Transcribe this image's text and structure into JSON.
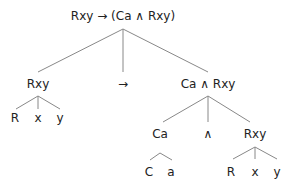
{
  "tree": {
    "root": {
      "label": "Rxy → (Ca ∧ Rxy)",
      "x": 123,
      "y": 16
    },
    "nodes": [
      {
        "id": "l1-rxy",
        "label": "Rxy",
        "x": 38,
        "y": 84
      },
      {
        "id": "l1-arrow",
        "label": "→",
        "x": 123,
        "y": 84
      },
      {
        "id": "l1-conj",
        "label": "Ca ∧ Rxy",
        "x": 208,
        "y": 84
      },
      {
        "id": "l2-R",
        "label": "R",
        "x": 15,
        "y": 118
      },
      {
        "id": "l2-x",
        "label": "x",
        "x": 38,
        "y": 118
      },
      {
        "id": "l2-y",
        "label": "y",
        "x": 60,
        "y": 118
      },
      {
        "id": "l2-Ca",
        "label": "Ca",
        "x": 160,
        "y": 134
      },
      {
        "id": "l2-and",
        "label": "∧",
        "x": 208,
        "y": 134
      },
      {
        "id": "l2-Rxy",
        "label": "Rxy",
        "x": 255,
        "y": 134
      },
      {
        "id": "l3-C",
        "label": "C",
        "x": 149,
        "y": 172
      },
      {
        "id": "l3-a",
        "label": "a",
        "x": 171,
        "y": 172
      },
      {
        "id": "l3-R",
        "label": "R",
        "x": 231,
        "y": 172
      },
      {
        "id": "l3-x",
        "label": "x",
        "x": 255,
        "y": 172
      },
      {
        "id": "l3-y",
        "label": "y",
        "x": 277,
        "y": 172
      }
    ],
    "edges": [
      [
        123,
        29,
        38,
        72
      ],
      [
        123,
        29,
        123,
        72
      ],
      [
        123,
        29,
        208,
        72
      ],
      [
        38,
        96,
        16,
        109
      ],
      [
        38,
        96,
        38,
        109
      ],
      [
        38,
        96,
        60,
        109
      ],
      [
        208,
        96,
        163,
        122
      ],
      [
        208,
        96,
        208,
        122
      ],
      [
        208,
        96,
        250,
        122
      ],
      [
        160,
        153,
        150,
        160
      ],
      [
        160,
        153,
        172,
        160
      ],
      [
        255,
        147,
        233,
        159
      ],
      [
        255,
        147,
        255,
        159
      ],
      [
        255,
        147,
        277,
        159
      ]
    ],
    "line_color": "#888888"
  }
}
